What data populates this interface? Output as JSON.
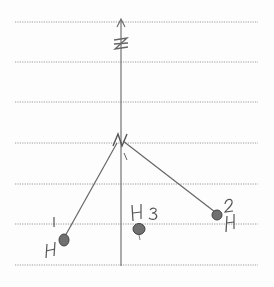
{
  "diagram": {
    "type": "hand-drawn molecular geometry sketch",
    "axis": {
      "label": "Z",
      "x": 121,
      "y_top": 20,
      "y_bottom": 266
    },
    "ruled_lines_y": [
      22,
      62,
      102,
      143,
      184,
      224,
      265
    ],
    "central_atom": {
      "label": "N",
      "x": 121,
      "y": 140
    },
    "atoms": [
      {
        "label": "H",
        "number": "1",
        "x": 63,
        "y": 240
      },
      {
        "label": "H",
        "number": "2",
        "x": 218,
        "y": 215
      },
      {
        "label": "H",
        "number": "3",
        "x": 139,
        "y": 230
      }
    ],
    "colors": {
      "ink": "#5a5a5a",
      "ruled": "#9a9a9a",
      "atom_fill": "#6a6a6a"
    }
  }
}
